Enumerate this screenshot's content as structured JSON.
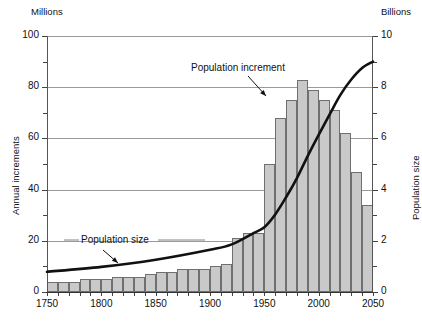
{
  "chart_data": {
    "type": "bar",
    "title": "",
    "subtitle": "",
    "xlabel": "",
    "ylabel": "Annual increments",
    "y2label": "Population size",
    "y_unit_label": "Millions",
    "y2_unit_label": "Billions",
    "xlim": [
      1750,
      2050
    ],
    "ylim": [
      0,
      100
    ],
    "y2lim": [
      0,
      10
    ],
    "yticks": [
      0,
      20,
      40,
      60,
      80,
      100
    ],
    "yticklabels": [
      "0",
      "20",
      "40",
      "60",
      "80",
      "100"
    ],
    "y_minor_ticks": [
      10,
      30,
      50,
      70,
      90
    ],
    "y2ticks": [
      0,
      2,
      4,
      6,
      8,
      10
    ],
    "y2ticklabels": [
      "0",
      "2",
      "4",
      "6",
      "8",
      "10"
    ],
    "y2_minor_ticks": [
      1,
      3,
      5,
      7,
      9
    ],
    "xticks": [
      1750,
      1760,
      1770,
      1780,
      1790,
      1800,
      1810,
      1820,
      1830,
      1840,
      1850,
      1860,
      1870,
      1880,
      1890,
      1900,
      1910,
      1920,
      1930,
      1940,
      1950,
      1960,
      1970,
      1980,
      1990,
      2000,
      2010,
      2020,
      2030,
      2040,
      2050
    ],
    "xticklabels_shown": [
      "1750",
      "1800",
      "1850",
      "1900",
      "1950",
      "2000",
      "2050"
    ],
    "xticklabel_positions": [
      1750,
      1800,
      1850,
      1900,
      1950,
      2000,
      2050
    ],
    "grid": "horizontal-major",
    "legend": "none",
    "bar_width_years": 10,
    "categories": [
      1750,
      1760,
      1770,
      1780,
      1790,
      1800,
      1810,
      1820,
      1830,
      1840,
      1850,
      1860,
      1870,
      1880,
      1890,
      1900,
      1910,
      1920,
      1930,
      1940,
      1950,
      1960,
      1970,
      1980,
      1990,
      2000,
      2010,
      2020,
      2030,
      2040
    ],
    "series": [
      {
        "name": "Population increment",
        "unit": "Millions per year",
        "axis": "left",
        "type": "bar",
        "color": "#c9c9c9",
        "edge_color": "#6f6f6f",
        "values": [
          4,
          4,
          4,
          5,
          5,
          5,
          6,
          6,
          6,
          7,
          8,
          8,
          9,
          9,
          9,
          10,
          11,
          21,
          23,
          23,
          50,
          68,
          75,
          83,
          79,
          75,
          71,
          62,
          47,
          34
        ]
      },
      {
        "name": "Population size",
        "unit": "Billions",
        "axis": "right",
        "type": "line",
        "color": "#111111",
        "x": [
          1750,
          1800,
          1850,
          1900,
          1920,
          1940,
          1950,
          1960,
          1970,
          1980,
          1990,
          2000,
          2010,
          2020,
          2030,
          2040,
          2050
        ],
        "values": [
          0.79,
          0.98,
          1.26,
          1.65,
          1.86,
          2.3,
          2.53,
          3.03,
          3.7,
          4.45,
          5.32,
          6.14,
          6.93,
          7.7,
          8.3,
          8.75,
          9.0
        ]
      }
    ],
    "annotations": [
      {
        "name": "population-increment",
        "text": "Population increment",
        "points_to": "tallest-bars",
        "arrow": "down-right"
      },
      {
        "name": "population-size",
        "text": "Population size",
        "points_to": "curve",
        "arrow": "down-right"
      }
    ]
  }
}
